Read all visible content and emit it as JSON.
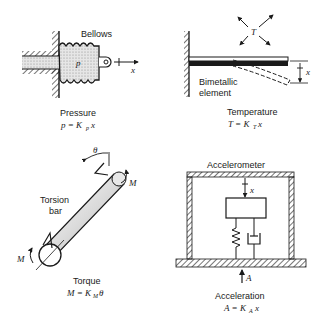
{
  "panels": {
    "pressure": {
      "component_label": "Bellows",
      "pressure_symbol": "p",
      "displacement_symbol": "x",
      "caption_title": "Pressure",
      "eq_lhs": "p = K",
      "eq_sub": "p",
      "eq_rhs": "x"
    },
    "temperature": {
      "temp_symbol": "T",
      "component_label_line1": "Bimetallic",
      "component_label_line2": "element",
      "displacement_symbol": "x",
      "caption_title": "Temperature",
      "eq_lhs": "T = K",
      "eq_sub": "T",
      "eq_rhs": "x"
    },
    "torque": {
      "angle_symbol": "θ",
      "moment_symbol_top": "M",
      "moment_symbol_bottom": "M",
      "component_label_line1": "Torsion",
      "component_label_line2": "bar",
      "caption_title": "Torque",
      "eq_lhs": "M = K",
      "eq_sub": "M",
      "eq_rhs": "θ"
    },
    "acceleration": {
      "component_label": "Accelerometer",
      "displacement_symbol": "x",
      "accel_symbol": "A",
      "caption_title": "Acceleration",
      "eq_lhs": "A = K",
      "eq_sub": "A",
      "eq_rhs": "x"
    }
  },
  "colors": {
    "ink": "#1a1a1a",
    "fluid_stipple": "#cfcfcf",
    "background": "#ffffff"
  }
}
